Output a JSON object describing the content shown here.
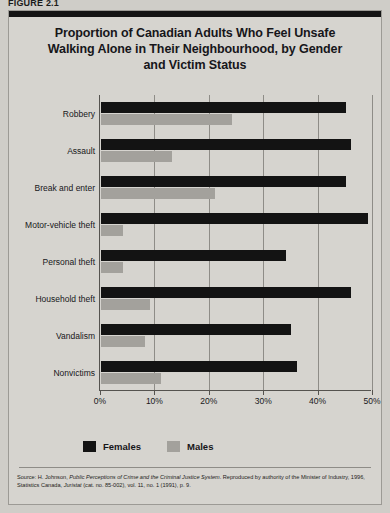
{
  "figure": {
    "label": "FIGURE 2.1",
    "title": "Proportion of Canadian Adults Who Feel Unsafe Walking Alone in Their Neighbourhood, by Gender and Victim Status",
    "title_line1": "Proportion of Canadian Adults Who Feel Unsafe",
    "title_line2": "Walking Alone in Their Neighbourhood, by Gender",
    "title_line3": "and Victim Status"
  },
  "source": {
    "prefix": "Source: H. Johnson, ",
    "italic1": "Public Perceptions of Crime and the Criminal Justice System",
    "middle": ". Reproduced by authority of the Minister of Industry, 1996, Statistics Canada, ",
    "italic2": "Juristat",
    "suffix": " (cat. no. 85-002), vol. 11, no. 1 (1991), p. 9."
  },
  "colors": {
    "females": "#131313",
    "males": "#a3a19c",
    "panel_background": "#d6d4cf",
    "page_background": "#cfcdc8",
    "axis": "#55534f",
    "grid": "#8e8c87"
  },
  "chart_data": {
    "type": "bar",
    "orientation": "horizontal",
    "title": "Proportion of Canadian Adults Who Feel Unsafe Walking Alone in Their Neighbourhood, by Gender and Victim Status",
    "xlabel": "",
    "ylabel": "",
    "xlim": [
      0,
      50
    ],
    "xticks": [
      0,
      10,
      20,
      30,
      40,
      50
    ],
    "xticklabels": [
      "0%",
      "10%",
      "20%",
      "30%",
      "40%",
      "50%"
    ],
    "grid": true,
    "legend_position": "bottom-left",
    "categories": [
      "Robbery",
      "Assault",
      "Break and enter",
      "Motor-vehicle theft",
      "Personal theft",
      "Household theft",
      "Vandalism",
      "Nonvictims"
    ],
    "series": [
      {
        "name": "Females",
        "color": "#131313",
        "values": [
          45,
          46,
          45,
          49,
          34,
          46,
          35,
          36
        ]
      },
      {
        "name": "Males",
        "color": "#a3a19c",
        "values": [
          24,
          13,
          21,
          4,
          4,
          9,
          8,
          11
        ]
      }
    ]
  }
}
